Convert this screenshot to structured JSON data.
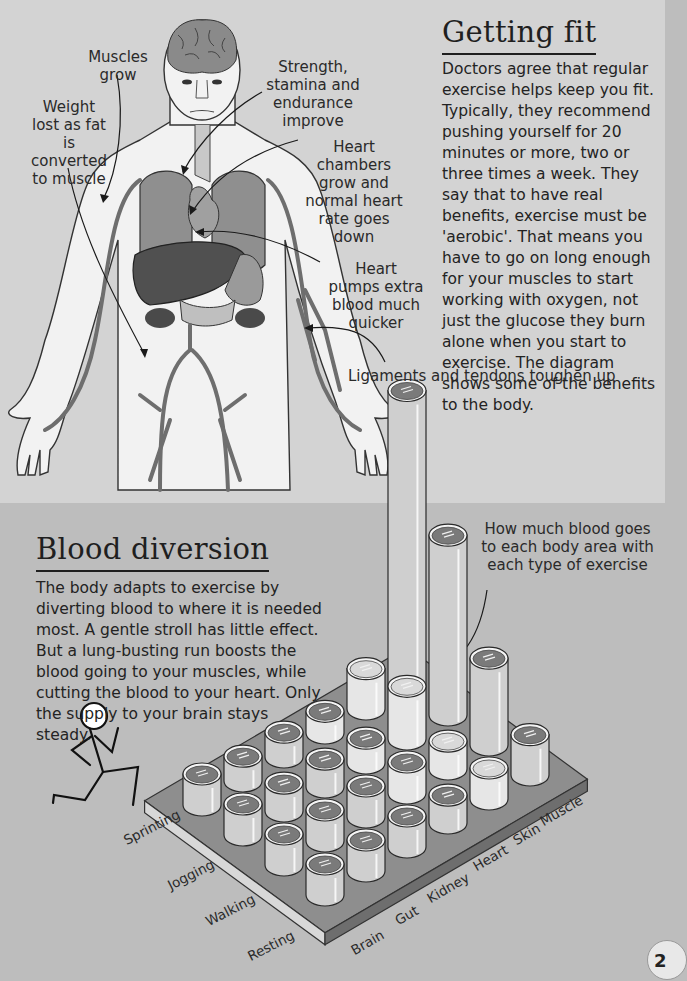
{
  "sections": {
    "getting_fit": {
      "title": "Getting fit",
      "body": "Doctors agree that regular exercise helps keep you fit. Typically, they recommend pushing yourself for 20 minutes or more, two or three times a week. They say that to have real benefits, exercise must be 'aerobic'. That means you have to go on long enough for your muscles to start working with oxygen, not just the glucose they burn alone when you start to exercise. The diagram shows some of the benefits to the body."
    },
    "blood_diversion": {
      "title": "Blood diversion",
      "body": "The body adapts to exercise by diverting blood to where it is needed most. A gentle stroll has little effect. But a lung-busting run boosts the blood going to your muscles, while cutting the blood to your heart. Only the supply to your brain stays steady."
    }
  },
  "body_diagram": {
    "annotations": [
      {
        "id": "muscles",
        "text": "Muscles grow"
      },
      {
        "id": "weight",
        "text": "Weight lost as fat is converted to muscle"
      },
      {
        "id": "strength",
        "text": "Strength, stamina and endurance improve"
      },
      {
        "id": "chambers",
        "text": "Heart chambers grow and normal heart rate goes down"
      },
      {
        "id": "pumps",
        "text": "Heart pumps extra blood much quicker"
      },
      {
        "id": "ligaments",
        "text": "Ligaments and tendons toughen up"
      }
    ],
    "icons": [
      "human-body-icon",
      "brain-icon",
      "heart-icon",
      "lungs-icon",
      "liver-icon",
      "blood-vessels-icon"
    ]
  },
  "chart_callout": "How much blood goes to each body area with each type of exercise",
  "runner_icon": "running-stick-figure-icon",
  "page_number": "2",
  "chart_data": {
    "type": "bar",
    "style": "3d-cylinders",
    "title": "Blood diversion",
    "xlabel": "Body area",
    "ylabel": "Exercise type",
    "categories": [
      "Brain",
      "Gut",
      "Kidney",
      "Heart",
      "Skin",
      "Muscle"
    ],
    "rows": [
      "Sprinting",
      "Jogging",
      "Walking",
      "Resting"
    ],
    "series": [
      {
        "name": "Resting",
        "values": [
          1.0,
          1.0,
          1.0,
          0.9,
          1.0,
          1.3
        ]
      },
      {
        "name": "Walking",
        "values": [
          1.0,
          1.0,
          1.0,
          1.0,
          0.9,
          2.8
        ]
      },
      {
        "name": "Jogging",
        "values": [
          1.0,
          0.9,
          0.9,
          0.8,
          1.7,
          5.8
        ]
      },
      {
        "name": "Sprinting",
        "values": [
          1.0,
          0.8,
          0.8,
          0.7,
          1.3,
          9.5
        ]
      }
    ],
    "units": "relative (estimated from cylinder heights)",
    "grid": false,
    "legend": "none"
  }
}
